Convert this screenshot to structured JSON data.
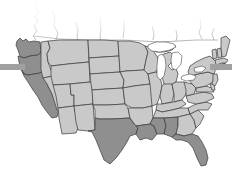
{
  "graphic": {
    "kind": "choropleth-map",
    "region": "Contiguous United States",
    "background_color": "#ffffff",
    "palette": {
      "state_fill_light": "#c9c9c9",
      "state_fill_dark": "#8f8f8f",
      "state_fill_mid": "#b0b0b0",
      "border_color": "#3a3a3a",
      "water_color": "#ffffff",
      "rule_bar_color": "#a0a0a0",
      "canada_border_color": "#8a8a8a"
    },
    "rule_bars": [
      {
        "name": "left-rule-bar",
        "color": "#a0a0a0",
        "x": 0,
        "y": 64,
        "width": 25,
        "height": 6
      },
      {
        "name": "right-rule-bar",
        "color": "#a0a0a0",
        "x": 210,
        "y": 64,
        "width": 22,
        "height": 6
      }
    ],
    "water_features": [
      {
        "name": "Lake Superior"
      },
      {
        "name": "Lake Michigan"
      },
      {
        "name": "Lake Huron"
      },
      {
        "name": "Lake Erie"
      },
      {
        "name": "Lake Ontario"
      }
    ],
    "canada_fade": {
      "present": true,
      "description": "Canadian provincial boundaries fading to white at top edge"
    },
    "highlighted_states": [
      "Washington",
      "Oregon",
      "California",
      "Texas",
      "Louisiana",
      "Mississippi",
      "Alabama",
      "Florida"
    ],
    "states": [
      {
        "code": "WA",
        "name": "Washington",
        "shade": "dark"
      },
      {
        "code": "OR",
        "name": "Oregon",
        "shade": "dark"
      },
      {
        "code": "CA",
        "name": "California",
        "shade": "dark"
      },
      {
        "code": "ID",
        "name": "Idaho",
        "shade": "light"
      },
      {
        "code": "NV",
        "name": "Nevada",
        "shade": "light"
      },
      {
        "code": "MT",
        "name": "Montana",
        "shade": "light"
      },
      {
        "code": "WY",
        "name": "Wyoming",
        "shade": "light"
      },
      {
        "code": "UT",
        "name": "Utah",
        "shade": "light"
      },
      {
        "code": "AZ",
        "name": "Arizona",
        "shade": "light"
      },
      {
        "code": "CO",
        "name": "Colorado",
        "shade": "light"
      },
      {
        "code": "NM",
        "name": "New Mexico",
        "shade": "light"
      },
      {
        "code": "ND",
        "name": "North Dakota",
        "shade": "light"
      },
      {
        "code": "SD",
        "name": "South Dakota",
        "shade": "light"
      },
      {
        "code": "NE",
        "name": "Nebraska",
        "shade": "light"
      },
      {
        "code": "KS",
        "name": "Kansas",
        "shade": "light"
      },
      {
        "code": "OK",
        "name": "Oklahoma",
        "shade": "light"
      },
      {
        "code": "TX",
        "name": "Texas",
        "shade": "dark"
      },
      {
        "code": "MN",
        "name": "Minnesota",
        "shade": "light"
      },
      {
        "code": "IA",
        "name": "Iowa",
        "shade": "light"
      },
      {
        "code": "MO",
        "name": "Missouri",
        "shade": "light"
      },
      {
        "code": "AR",
        "name": "Arkansas",
        "shade": "light"
      },
      {
        "code": "LA",
        "name": "Louisiana",
        "shade": "dark"
      },
      {
        "code": "WI",
        "name": "Wisconsin",
        "shade": "light"
      },
      {
        "code": "IL",
        "name": "Illinois",
        "shade": "light"
      },
      {
        "code": "MI",
        "name": "Michigan",
        "shade": "light"
      },
      {
        "code": "IN",
        "name": "Indiana",
        "shade": "light"
      },
      {
        "code": "OH",
        "name": "Ohio",
        "shade": "light"
      },
      {
        "code": "KY",
        "name": "Kentucky",
        "shade": "light"
      },
      {
        "code": "TN",
        "name": "Tennessee",
        "shade": "light"
      },
      {
        "code": "MS",
        "name": "Mississippi",
        "shade": "dark"
      },
      {
        "code": "AL",
        "name": "Alabama",
        "shade": "dark"
      },
      {
        "code": "GA",
        "name": "Georgia",
        "shade": "light"
      },
      {
        "code": "FL",
        "name": "Florida",
        "shade": "dark"
      },
      {
        "code": "SC",
        "name": "South Carolina",
        "shade": "light"
      },
      {
        "code": "NC",
        "name": "North Carolina",
        "shade": "light"
      },
      {
        "code": "VA",
        "name": "Virginia",
        "shade": "light"
      },
      {
        "code": "WV",
        "name": "West Virginia",
        "shade": "light"
      },
      {
        "code": "MD",
        "name": "Maryland",
        "shade": "light"
      },
      {
        "code": "DE",
        "name": "Delaware",
        "shade": "light"
      },
      {
        "code": "PA",
        "name": "Pennsylvania",
        "shade": "light"
      },
      {
        "code": "NJ",
        "name": "New Jersey",
        "shade": "light"
      },
      {
        "code": "NY",
        "name": "New York",
        "shade": "light"
      },
      {
        "code": "CT",
        "name": "Connecticut",
        "shade": "light"
      },
      {
        "code": "RI",
        "name": "Rhode Island",
        "shade": "light"
      },
      {
        "code": "MA",
        "name": "Massachusetts",
        "shade": "light"
      },
      {
        "code": "VT",
        "name": "Vermont",
        "shade": "light"
      },
      {
        "code": "NH",
        "name": "New Hampshire",
        "shade": "light"
      },
      {
        "code": "ME",
        "name": "Maine",
        "shade": "light"
      }
    ]
  }
}
